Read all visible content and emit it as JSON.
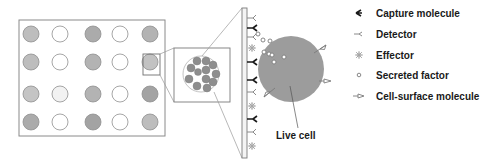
{
  "diagram": {
    "type": "microwell-array-schematic",
    "array": {
      "rows": 4,
      "cols": 5,
      "wells": [
        [
          "filled",
          "empty",
          "filled",
          "empty",
          "filled"
        ],
        [
          "filled",
          "empty",
          "filled",
          "empty",
          "filled"
        ],
        [
          "filled",
          "empty",
          "filled",
          "empty",
          "filled"
        ],
        [
          "filled",
          "empty",
          "filled",
          "empty",
          "filled"
        ]
      ],
      "highlighted_well": {
        "row": 1,
        "col": 4
      }
    },
    "cell_label": "Live cell",
    "legend": [
      {
        "icon": "capture-molecule-icon",
        "label": "Capture molecule"
      },
      {
        "icon": "detector-icon",
        "label": "Detector"
      },
      {
        "icon": "effector-icon",
        "label": "Effector"
      },
      {
        "icon": "secreted-factor-icon",
        "label": "Secreted factor"
      },
      {
        "icon": "cell-surface-molecule-icon",
        "label": "Cell-surface molecule"
      }
    ],
    "colors": {
      "well_fill": "#b8b8b8",
      "well_fill_dark": "#a6a6a6",
      "cell_fill": "#9a9a9a",
      "stroke": "#7a7a7a",
      "text": "#1a1a1a"
    }
  }
}
